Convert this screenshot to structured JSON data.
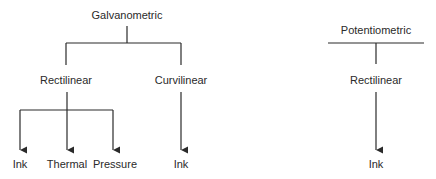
{
  "diagram": {
    "galvanometric": {
      "label": "Galvanometric",
      "children": {
        "rectilinear": {
          "label": "Rectilinear",
          "children": [
            "Ink",
            "Thermal",
            "Pressure"
          ]
        },
        "curvilinear": {
          "label": "Curvilinear",
          "children": [
            "Ink"
          ]
        }
      }
    },
    "potentiometric": {
      "label": "Potentiometric",
      "children": {
        "rectilinear": {
          "label": "Rectilinear",
          "children": [
            "Ink"
          ]
        }
      }
    }
  },
  "colors": {
    "line": "#2a2a2a",
    "background": "#ffffff"
  }
}
